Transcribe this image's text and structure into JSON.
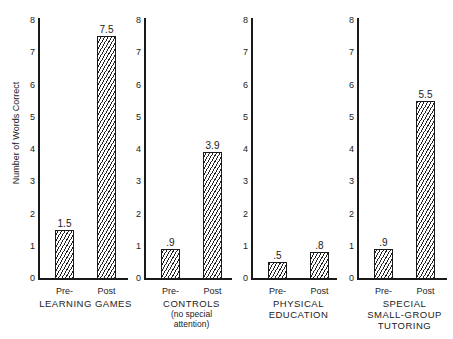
{
  "chart_data": {
    "type": "bar",
    "ylabel": "Number of Words Correct",
    "ylim": [
      0,
      8
    ],
    "yticks": [
      "0",
      "1",
      "2",
      "3",
      "4",
      "5",
      "6",
      "7",
      "8"
    ],
    "categories": [
      "Pre-",
      "Post"
    ],
    "panels": [
      {
        "group": "LEARNING GAMES",
        "group_lines": [
          "LEARNING  GAMES"
        ],
        "subtitle": "",
        "values": [
          1.5,
          7.5
        ],
        "value_labels": [
          "1.5",
          "7.5"
        ]
      },
      {
        "group": "CONTROLS",
        "group_lines": [
          "CONTROLS"
        ],
        "subtitle_lines": [
          "(no special",
          "attention)"
        ],
        "values": [
          0.9,
          3.9
        ],
        "value_labels": [
          ".9",
          "3.9"
        ]
      },
      {
        "group": "PHYSICAL EDUCATION",
        "group_lines": [
          "PHYSICAL",
          "EDUCATION"
        ],
        "subtitle": "",
        "values": [
          0.5,
          0.8
        ],
        "value_labels": [
          ".5",
          ".8"
        ]
      },
      {
        "group": "SPECIAL SMALL-GROUP TUTORING",
        "group_lines": [
          "SPECIAL",
          "SMALL-GROUP",
          "TUTORING"
        ],
        "subtitle": "",
        "values": [
          0.9,
          5.5
        ],
        "value_labels": [
          ".9",
          "5.5"
        ]
      }
    ],
    "bar_fill": "diagonal hatch",
    "grid": false,
    "legend": "none"
  },
  "labels": {
    "ylabel": "Number of Words Correct",
    "pre": "Pre-",
    "post": "Post",
    "ticks": [
      "0",
      "1",
      "2",
      "3",
      "4",
      "5",
      "6",
      "7",
      "8"
    ],
    "panels": [
      {
        "v0": "1.5",
        "v1": "7.5",
        "g0": "LEARNING  GAMES",
        "g1": "",
        "g2": "",
        "s0": "",
        "s1": ""
      },
      {
        "v0": ".9",
        "v1": "3.9",
        "g0": "CONTROLS",
        "g1": "",
        "g2": "",
        "s0": "(no special",
        "s1": "attention)"
      },
      {
        "v0": ".5",
        "v1": ".8",
        "g0": "PHYSICAL",
        "g1": "EDUCATION",
        "g2": "",
        "s0": "",
        "s1": ""
      },
      {
        "v0": ".9",
        "v1": "5.5",
        "g0": "SPECIAL",
        "g1": "SMALL-GROUP",
        "g2": "TUTORING",
        "s0": "",
        "s1": ""
      }
    ]
  }
}
